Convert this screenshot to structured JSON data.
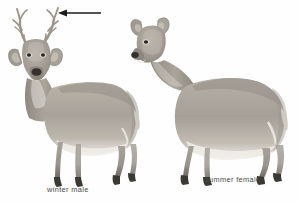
{
  "figure": {
    "background_color": "#fefefe",
    "style": "grayscale-wash-field-guide-illustration",
    "captions": {
      "winter_male": "winter male",
      "summer_female": "summer female"
    },
    "annotation": {
      "name": "antler-pointer-arrow",
      "direction": "left",
      "points_to": "antlers of winter male",
      "color": "#1a1a1a",
      "x_start": 101,
      "x_end": 59,
      "y": 13
    },
    "palette": {
      "coat_light": "#cfc9c1",
      "coat_mid": "#a9a39a",
      "coat_dark": "#7d776f",
      "shadow": "#5f5a53",
      "belly_white": "#f2f0ec",
      "hoof_dark": "#3b3934",
      "muzzle_dark": "#33312d",
      "caption_text": "#4a4a4a",
      "antler": "#b5ada2"
    },
    "animals": [
      {
        "id": "winter-male",
        "label": "winter male",
        "pose": "standing, head turned toward viewer",
        "has_antlers": true,
        "antler_points": 8,
        "season": "winter",
        "sex": "male",
        "bounds": {
          "x": 8,
          "y": 8,
          "width": 137,
          "height": 180
        }
      },
      {
        "id": "summer-female",
        "label": "summer female",
        "pose": "standing in profile, facing left",
        "has_antlers": false,
        "season": "summer",
        "sex": "female",
        "bounds": {
          "x": 125,
          "y": 14,
          "width": 160,
          "height": 172
        }
      }
    ]
  }
}
